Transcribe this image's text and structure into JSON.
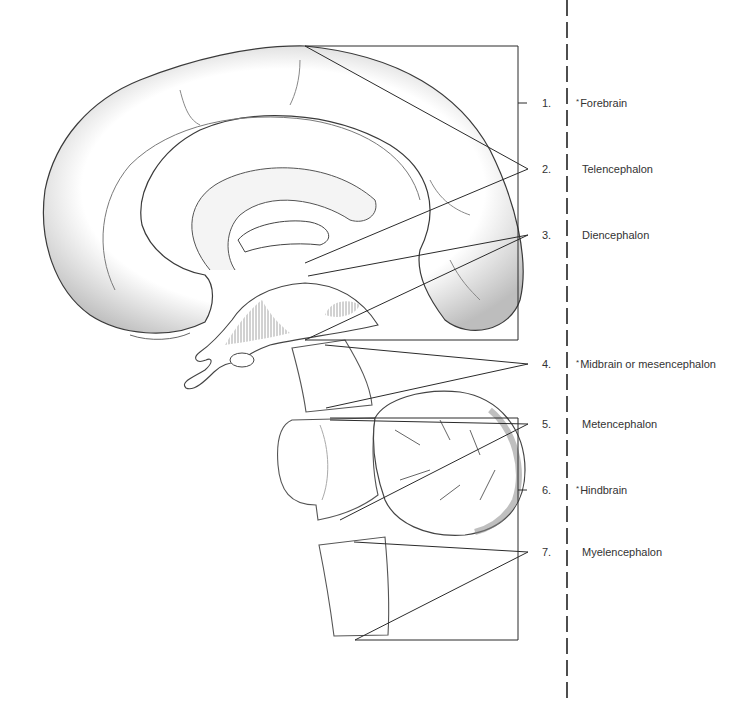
{
  "diagram": {
    "labels": [
      {
        "number": "1.",
        "star": "*",
        "text": "Forebrain",
        "y": 103
      },
      {
        "number": "2.",
        "star": "",
        "text": "Telencephalon",
        "y": 169
      },
      {
        "number": "3.",
        "star": "",
        "text": "Diencephalon",
        "y": 235
      },
      {
        "number": "4.",
        "star": "*",
        "text": "Midbrain or mesencephalon",
        "y": 364
      },
      {
        "number": "5.",
        "star": "",
        "text": "Metencephalon",
        "y": 424
      },
      {
        "number": "6.",
        "star": "*",
        "text": "Hindbrain",
        "y": 490
      },
      {
        "number": "7.",
        "star": "",
        "text": "Myelencephalon",
        "y": 552
      }
    ],
    "colors": {
      "line": "#2b2b2b",
      "shading": "#9a9a9a",
      "background": "#ffffff"
    }
  }
}
